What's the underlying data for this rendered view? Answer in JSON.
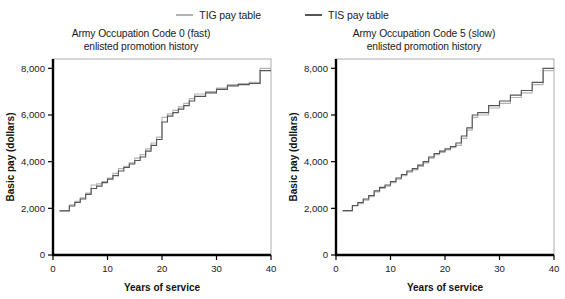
{
  "legend": {
    "position": "top-center",
    "entries": [
      {
        "label": "TIG pay table",
        "color": "#b3b3b3",
        "name": "tig"
      },
      {
        "label": "TIS pay table",
        "color": "#555555",
        "name": "tis"
      }
    ]
  },
  "panels": [
    {
      "id": "left",
      "title_line1": "Army Occupation Code 0 (fast)",
      "title_line2": "enlisted promotion history"
    },
    {
      "id": "right",
      "title_line1": "Army Occupation Code 5 (slow)",
      "title_line2": "enlisted promotion history"
    }
  ],
  "axes": {
    "x_label": "Years of service",
    "y_label": "Basic pay (dollars)",
    "x_ticks": [
      "0",
      "10",
      "20",
      "30",
      "40"
    ],
    "y_ticks": [
      "0",
      "2,000",
      "4,000",
      "6,000",
      "8,000"
    ],
    "xlim": [
      0,
      40
    ],
    "ylim": [
      0,
      8400
    ]
  },
  "chart_data": [
    {
      "type": "line",
      "drawstyle": "steps-post",
      "title": "Army Occupation Code 0 (fast) enlisted promotion history",
      "xlabel": "Years of service",
      "ylabel": "Basic pay (dollars)",
      "xlim": [
        0,
        40
      ],
      "ylim": [
        0,
        8400
      ],
      "xticks": [
        0,
        10,
        20,
        30,
        40
      ],
      "yticks": [
        0,
        2000,
        4000,
        6000,
        8000
      ],
      "grid": false,
      "legend_position": "above-figure",
      "series": [
        {
          "name": "TIG pay table",
          "color": "#b3b3b3",
          "x": [
            1.2,
            2.0,
            3.0,
            4.0,
            5.0,
            6.0,
            7.0,
            8.0,
            9.0,
            10.0,
            11.0,
            12.0,
            13.0,
            14.0,
            15.0,
            16.0,
            17.0,
            18.0,
            19.0,
            20.0,
            21.0,
            22.0,
            23.0,
            24.0,
            25.0,
            26.0,
            28.0,
            30.0,
            32.0,
            34.0,
            36.0,
            38.0,
            40.0
          ],
          "y": [
            1900,
            1900,
            2150,
            2300,
            2450,
            2650,
            3000,
            3050,
            3150,
            3300,
            3500,
            3700,
            3800,
            3950,
            4150,
            4300,
            4550,
            4800,
            5050,
            5900,
            6050,
            6200,
            6350,
            6500,
            6700,
            6900,
            7000,
            7150,
            7300,
            7350,
            7400,
            8000,
            8000
          ]
        },
        {
          "name": "TIS pay table",
          "color": "#555555",
          "x": [
            1.2,
            2.0,
            3.0,
            4.0,
            5.0,
            6.0,
            7.0,
            8.0,
            9.0,
            10.0,
            11.0,
            12.0,
            13.0,
            14.0,
            15.0,
            16.0,
            17.0,
            18.0,
            19.0,
            20.0,
            21.0,
            22.0,
            23.0,
            24.0,
            25.0,
            26.0,
            28.0,
            30.0,
            32.0,
            34.0,
            36.0,
            38.0,
            40.0
          ],
          "y": [
            1890,
            1890,
            2100,
            2250,
            2400,
            2600,
            2850,
            2950,
            3100,
            3250,
            3400,
            3600,
            3750,
            3900,
            4050,
            4200,
            4450,
            4700,
            4950,
            5700,
            5950,
            6100,
            6250,
            6400,
            6600,
            6800,
            6950,
            7100,
            7250,
            7300,
            7350,
            7900,
            7900
          ]
        }
      ]
    },
    {
      "type": "line",
      "drawstyle": "steps-post",
      "title": "Army Occupation Code 5 (slow) enlisted promotion history",
      "xlabel": "Years of service",
      "ylabel": "Basic pay (dollars)",
      "xlim": [
        0,
        40
      ],
      "ylim": [
        0,
        8400
      ],
      "xticks": [
        0,
        10,
        20,
        30,
        40
      ],
      "yticks": [
        0,
        2000,
        4000,
        6000,
        8000
      ],
      "grid": false,
      "legend_position": "above-figure",
      "series": [
        {
          "name": "TIG pay table",
          "color": "#b3b3b3",
          "x": [
            1.2,
            2.0,
            3.0,
            4.0,
            5.0,
            6.0,
            7.0,
            8.0,
            9.0,
            10.0,
            11.0,
            12.0,
            13.0,
            14.0,
            15.0,
            16.0,
            17.0,
            18.0,
            19.0,
            20.0,
            21.0,
            22.0,
            23.0,
            24.0,
            25.0,
            26.0,
            28.0,
            30.0,
            32.0,
            34.0,
            36.0,
            38.0,
            40.0
          ],
          "y": [
            1890,
            1890,
            2100,
            2200,
            2350,
            2500,
            2700,
            2850,
            2950,
            3100,
            3250,
            3400,
            3550,
            3650,
            3800,
            3950,
            4150,
            4300,
            4400,
            4500,
            4600,
            4700,
            5000,
            5350,
            5900,
            6000,
            6300,
            6500,
            6750,
            6950,
            7300,
            7900,
            7900
          ]
        },
        {
          "name": "TIS pay table",
          "color": "#555555",
          "x": [
            1.2,
            2.0,
            3.0,
            4.0,
            5.0,
            6.0,
            7.0,
            8.0,
            9.0,
            10.0,
            11.0,
            12.0,
            13.0,
            14.0,
            15.0,
            16.0,
            17.0,
            18.0,
            19.0,
            20.0,
            21.0,
            22.0,
            23.0,
            24.0,
            25.0,
            26.0,
            28.0,
            30.0,
            32.0,
            34.0,
            36.0,
            38.0,
            40.0
          ],
          "y": [
            1900,
            1900,
            2120,
            2250,
            2400,
            2550,
            2750,
            2900,
            3000,
            3150,
            3300,
            3450,
            3600,
            3700,
            3850,
            4000,
            4200,
            4350,
            4450,
            4550,
            4650,
            4800,
            5100,
            5450,
            6000,
            6100,
            6400,
            6600,
            6850,
            7050,
            7400,
            8000,
            8000
          ]
        }
      ]
    }
  ]
}
